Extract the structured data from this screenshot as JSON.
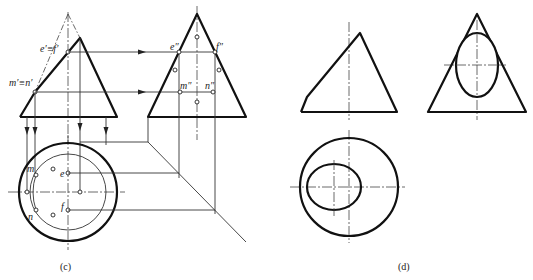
{
  "figure_c": {
    "caption": "(c)",
    "labels": {
      "ef_front": "e′≡f′",
      "mn_front": "m′≡n′",
      "e_side": "e″",
      "f_side": "f″",
      "m_side": "m″",
      "n_side": "n″",
      "m_top": "m",
      "n_top": "n",
      "e_top": "e",
      "f_top": "f"
    }
  },
  "figure_d": {
    "caption": "(d)"
  }
}
